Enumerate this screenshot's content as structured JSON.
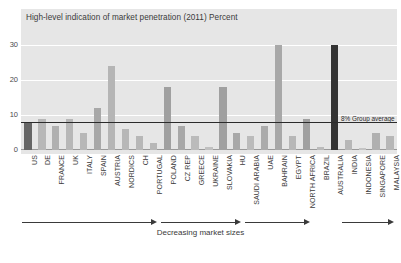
{
  "chart_data": {
    "type": "bar",
    "title": "High-level indication of market penetration (2011) Percent",
    "xlabel": "Decreasing market sizes",
    "ylabel": "",
    "ylim": [
      0,
      32
    ],
    "yticks": [
      0,
      10,
      20,
      30
    ],
    "ytick_labels": [
      "0",
      "10",
      "20",
      "30"
    ],
    "grid": true,
    "legend_position": "none",
    "categories": [
      "US",
      "DE",
      "FRANCE",
      "UK",
      "ITALY",
      "SPAIN",
      "AUSTRIA",
      "NORDICS",
      "CH",
      "PORTUGAL",
      "POLAND",
      "CZ REP",
      "GREECE",
      "UKRAINE",
      "SLOVAKIA",
      "HU",
      "SAUDI ARABIA",
      "UAE",
      "BAHRAIN",
      "EGYPT",
      "NORTH AFRICA",
      "BRAZIL",
      "AUSTRALIA",
      "INDIA",
      "INDONESIA",
      "SINGAPORE",
      "MALAYSIA"
    ],
    "values": [
      8,
      9,
      7,
      9,
      5,
      12,
      24,
      6,
      4,
      2,
      18,
      7,
      4,
      1,
      18,
      5,
      4,
      7,
      30,
      4,
      9,
      1,
      30,
      3,
      0.7,
      5,
      4
    ],
    "bar_colors": [
      "#666666",
      "#b7b7b7",
      "#b0b0b0",
      "#b7b7b7",
      "#b7b7b7",
      "#a8a8a8",
      "#b5b5b5",
      "#b7b7b7",
      "#b7b7b7",
      "#b7b7b7",
      "#a0a0a0",
      "#a8a8a8",
      "#bbbbbb",
      "#c0c0c0",
      "#a0a0a0",
      "#a8a8a8",
      "#bbbbbb",
      "#ababab",
      "#a8a8a8",
      "#b7b7b7",
      "#a0a0a0",
      "#bbbbbb",
      "#333333",
      "#b7b7b7",
      "#c4c4c4",
      "#b0b0b0",
      "#b7b7b7"
    ],
    "annotations": [
      {
        "name": "group-average",
        "value": 8,
        "label": "8% Group average"
      }
    ],
    "segments": [
      {
        "label": "",
        "from": "US",
        "to": "PORTUGAL"
      },
      {
        "label": "",
        "from": "POLAND",
        "to": "HU"
      },
      {
        "label": "",
        "from": "SAUDI ARABIA",
        "to": "NORTH AFRICA"
      },
      {
        "label": "",
        "from": "INDIA",
        "to": "MALAYSIA"
      }
    ]
  },
  "panel": {
    "background_color": "#e6e6e6",
    "gridline_color": "#ffffff",
    "axis_color": "#9a9a9a"
  }
}
